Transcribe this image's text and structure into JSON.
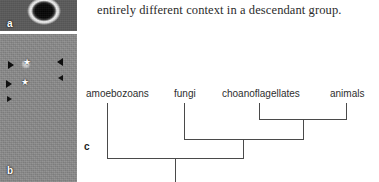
{
  "body_text": {
    "line": "entirely different context in a descendant group."
  },
  "panels": {
    "a": {
      "letter": "a",
      "caption": "dark circular cell with bright halo micrograph"
    },
    "b": {
      "letter": "b",
      "caption": "grayscale micrograph of a vertical cell colony with arrowheads and star marks"
    },
    "c": {
      "letter": "c",
      "caption": "cladogram of opisthokont relationships"
    }
  },
  "cladogram": {
    "type": "phylogenetic-tree",
    "taxa": [
      {
        "id": "amoebozoans",
        "label": "amoebozoans"
      },
      {
        "id": "fungi",
        "label": "fungi"
      },
      {
        "id": "choanoflagellates",
        "label": "choanoflagellates"
      },
      {
        "id": "animals",
        "label": "animals"
      }
    ],
    "clades": [
      {
        "name": "choanoflagellates + animals",
        "members": [
          "choanoflagellates",
          "animals"
        ]
      },
      {
        "name": "fungi + (choanoflagellates + animals)",
        "members": [
          "fungi",
          "choanoflagellates",
          "animals"
        ]
      },
      {
        "name": "root",
        "members": [
          "amoebozoans",
          "fungi",
          "choanoflagellates",
          "animals"
        ]
      }
    ],
    "line_color": "#4a4a4a"
  }
}
